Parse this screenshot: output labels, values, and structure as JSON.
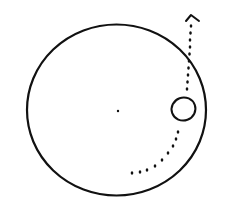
{
  "diagram": {
    "description": "Hand-drawn sketch: large circle with center dot, a small ellipse near the right inner edge, and a dotted trajectory curving from the lower interior up through the small ellipse and exiting the large circle upward, ending in an arrowhead.",
    "colors": {
      "background": "#ffffff",
      "stroke": "#111111"
    },
    "large_circle": {
      "cx": 116.5,
      "cy": 110,
      "rx": 89.5,
      "ry": 85.5,
      "stroke_width": 2.2
    },
    "center_dot": {
      "cx": 118,
      "cy": 111,
      "r": 1.2
    },
    "small_body": {
      "cx": 183.5,
      "cy": 109,
      "rx": 12,
      "ry": 11.5,
      "rotate": -20,
      "stroke_width": 2
    },
    "trajectory_dots_lower": [
      [
        132,
        173
      ],
      [
        140,
        172
      ],
      [
        147,
        170
      ],
      [
        155,
        166
      ],
      [
        162,
        160
      ],
      [
        168,
        153
      ],
      [
        173,
        146
      ],
      [
        176,
        139
      ],
      [
        178,
        132
      ]
    ],
    "trajectory_dots_upper": [
      [
        187,
        89
      ],
      [
        187.5,
        82
      ],
      [
        188,
        75
      ],
      [
        188.5,
        68
      ],
      [
        189,
        61
      ],
      [
        189.5,
        54
      ],
      [
        190,
        47
      ],
      [
        190,
        40
      ],
      [
        190.5,
        33
      ],
      [
        191,
        26
      ]
    ],
    "arrowhead": {
      "apex": [
        191,
        15
      ],
      "left": [
        186,
        21
      ],
      "right": [
        199,
        21
      ]
    }
  }
}
